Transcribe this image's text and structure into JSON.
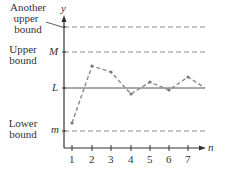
{
  "diagram": {
    "axes": {
      "x_label": "n",
      "y_label": "y",
      "x_ticks": [
        "1",
        "2",
        "3",
        "4",
        "5",
        "6",
        "7"
      ]
    },
    "levels": {
      "another_upper": {
        "label_line1": "Another",
        "label_line2": "upper",
        "label_line3": "bound",
        "style": "dashed"
      },
      "upper": {
        "symbol": "M",
        "label_line1": "Upper",
        "label_line2": "bound",
        "style": "dashed"
      },
      "limit": {
        "symbol": "L",
        "style": "solid"
      },
      "lower": {
        "symbol": "m",
        "label_line1": "Lower",
        "label_line2": "bound",
        "style": "dashed"
      }
    },
    "sequence_points_px": [
      [
        72,
        123
      ],
      [
        92,
        66
      ],
      [
        111,
        72
      ],
      [
        131,
        94
      ],
      [
        150,
        82
      ],
      [
        169,
        90
      ],
      [
        188,
        77
      ],
      [
        205,
        88
      ]
    ],
    "colors": {
      "axis": "#333333",
      "dashed": "#888888",
      "sequence": "#8a8a8a",
      "text": "#333333"
    }
  }
}
